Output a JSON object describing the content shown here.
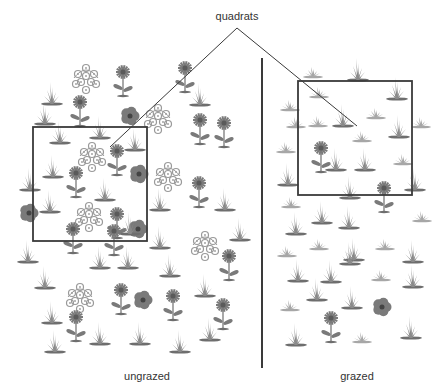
{
  "title_label": "quadrats",
  "panels": [
    {
      "id": "ungrazed",
      "label": "ungrazed",
      "label_pos": {
        "x": 147,
        "y": 370
      },
      "quadrat": {
        "x": 33,
        "y": 127,
        "w": 114,
        "h": 114
      },
      "pointer_end": {
        "x": 110,
        "y": 147
      },
      "plants": [
        {
          "type": "grass",
          "x": 52,
          "y": 104
        },
        {
          "type": "cluster",
          "x": 86,
          "y": 80
        },
        {
          "type": "daisy",
          "x": 123,
          "y": 82
        },
        {
          "type": "daisy",
          "x": 185,
          "y": 78
        },
        {
          "type": "daisy",
          "x": 80,
          "y": 112
        },
        {
          "type": "hibiscus",
          "x": 130,
          "y": 116
        },
        {
          "type": "cluster",
          "x": 158,
          "y": 120
        },
        {
          "type": "grass",
          "x": 45,
          "y": 124
        },
        {
          "type": "grass",
          "x": 100,
          "y": 138
        },
        {
          "type": "grass",
          "x": 200,
          "y": 105
        },
        {
          "type": "daisy",
          "x": 200,
          "y": 130
        },
        {
          "type": "daisy",
          "x": 224,
          "y": 133
        },
        {
          "type": "grass",
          "x": 60,
          "y": 143
        },
        {
          "type": "cluster",
          "x": 92,
          "y": 158
        },
        {
          "type": "daisy",
          "x": 117,
          "y": 161
        },
        {
          "type": "grass",
          "x": 135,
          "y": 150
        },
        {
          "type": "hibiscus",
          "x": 139,
          "y": 174
        },
        {
          "type": "cluster",
          "x": 168,
          "y": 178
        },
        {
          "type": "grass",
          "x": 53,
          "y": 177
        },
        {
          "type": "grass",
          "x": 30,
          "y": 190
        },
        {
          "type": "daisy",
          "x": 76,
          "y": 183
        },
        {
          "type": "grass",
          "x": 105,
          "y": 200
        },
        {
          "type": "grass",
          "x": 160,
          "y": 210
        },
        {
          "type": "daisy",
          "x": 199,
          "y": 193
        },
        {
          "type": "grass",
          "x": 225,
          "y": 210
        },
        {
          "type": "hibiscus",
          "x": 29,
          "y": 213
        },
        {
          "type": "grass",
          "x": 50,
          "y": 212
        },
        {
          "type": "cluster",
          "x": 89,
          "y": 218
        },
        {
          "type": "daisy",
          "x": 117,
          "y": 224
        },
        {
          "type": "hibiscus",
          "x": 138,
          "y": 229
        },
        {
          "type": "grass",
          "x": 130,
          "y": 234
        },
        {
          "type": "daisy",
          "x": 73,
          "y": 239
        },
        {
          "type": "daisy",
          "x": 114,
          "y": 241
        },
        {
          "type": "cluster",
          "x": 205,
          "y": 247
        },
        {
          "type": "grass",
          "x": 240,
          "y": 240
        },
        {
          "type": "grass",
          "x": 160,
          "y": 248
        },
        {
          "type": "grass",
          "x": 28,
          "y": 262
        },
        {
          "type": "grass",
          "x": 100,
          "y": 268
        },
        {
          "type": "grass",
          "x": 128,
          "y": 268
        },
        {
          "type": "grass",
          "x": 170,
          "y": 276
        },
        {
          "type": "daisy",
          "x": 229,
          "y": 266
        },
        {
          "type": "grass",
          "x": 45,
          "y": 288
        },
        {
          "type": "cluster",
          "x": 80,
          "y": 299
        },
        {
          "type": "daisy",
          "x": 121,
          "y": 300
        },
        {
          "type": "hibiscus",
          "x": 143,
          "y": 300
        },
        {
          "type": "daisy",
          "x": 173,
          "y": 306
        },
        {
          "type": "grass",
          "x": 205,
          "y": 296
        },
        {
          "type": "daisy",
          "x": 223,
          "y": 315
        },
        {
          "type": "grass",
          "x": 52,
          "y": 323
        },
        {
          "type": "daisy",
          "x": 76,
          "y": 327
        },
        {
          "type": "grass",
          "x": 100,
          "y": 344
        },
        {
          "type": "grass",
          "x": 140,
          "y": 344
        },
        {
          "type": "grass",
          "x": 180,
          "y": 352
        },
        {
          "type": "grass",
          "x": 55,
          "y": 352
        },
        {
          "type": "grass",
          "x": 210,
          "y": 340
        }
      ]
    },
    {
      "id": "grazed",
      "label": "grazed",
      "label_pos": {
        "x": 357,
        "y": 370
      },
      "quadrat": {
        "x": 298,
        "y": 81,
        "w": 114,
        "h": 114
      },
      "pointer_end": {
        "x": 357,
        "y": 126
      },
      "plants": [
        {
          "type": "tuft",
          "x": 313,
          "y": 77
        },
        {
          "type": "grass",
          "x": 358,
          "y": 80
        },
        {
          "type": "grass",
          "x": 397,
          "y": 99
        },
        {
          "type": "tuft",
          "x": 319,
          "y": 97
        },
        {
          "type": "tuft",
          "x": 290,
          "y": 110
        },
        {
          "type": "tuft",
          "x": 376,
          "y": 118
        },
        {
          "type": "tuft",
          "x": 296,
          "y": 127
        },
        {
          "type": "tuft",
          "x": 318,
          "y": 126
        },
        {
          "type": "grass",
          "x": 343,
          "y": 126
        },
        {
          "type": "tuft",
          "x": 362,
          "y": 141
        },
        {
          "type": "grass",
          "x": 399,
          "y": 137
        },
        {
          "type": "tuft",
          "x": 421,
          "y": 127
        },
        {
          "type": "tuft",
          "x": 286,
          "y": 152
        },
        {
          "type": "daisy",
          "x": 321,
          "y": 158
        },
        {
          "type": "grass",
          "x": 336,
          "y": 170
        },
        {
          "type": "grass",
          "x": 365,
          "y": 170
        },
        {
          "type": "tuft",
          "x": 403,
          "y": 164
        },
        {
          "type": "grass",
          "x": 288,
          "y": 185
        },
        {
          "type": "grass",
          "x": 415,
          "y": 190
        },
        {
          "type": "grass",
          "x": 350,
          "y": 198
        },
        {
          "type": "daisy",
          "x": 384,
          "y": 198
        },
        {
          "type": "tuft",
          "x": 291,
          "y": 207
        },
        {
          "type": "grass",
          "x": 322,
          "y": 223
        },
        {
          "type": "grass",
          "x": 349,
          "y": 228
        },
        {
          "type": "tuft",
          "x": 422,
          "y": 221
        },
        {
          "type": "grass",
          "x": 296,
          "y": 234
        },
        {
          "type": "tuft",
          "x": 319,
          "y": 249
        },
        {
          "type": "grass",
          "x": 354,
          "y": 260
        },
        {
          "type": "tuft",
          "x": 385,
          "y": 249
        },
        {
          "type": "grass",
          "x": 413,
          "y": 262
        },
        {
          "type": "tuft",
          "x": 287,
          "y": 256
        },
        {
          "type": "grass",
          "x": 298,
          "y": 281
        },
        {
          "type": "grass",
          "x": 331,
          "y": 282
        },
        {
          "type": "grass",
          "x": 350,
          "y": 264
        },
        {
          "type": "tuft",
          "x": 381,
          "y": 280
        },
        {
          "type": "grass",
          "x": 413,
          "y": 287
        },
        {
          "type": "grass",
          "x": 317,
          "y": 300
        },
        {
          "type": "tuft",
          "x": 290,
          "y": 310
        },
        {
          "type": "grass",
          "x": 352,
          "y": 308
        },
        {
          "type": "hibiscus",
          "x": 382,
          "y": 307
        },
        {
          "type": "daisy",
          "x": 331,
          "y": 328
        },
        {
          "type": "grass",
          "x": 296,
          "y": 345
        },
        {
          "type": "tuft",
          "x": 362,
          "y": 342
        },
        {
          "type": "grass",
          "x": 411,
          "y": 338
        }
      ]
    }
  ],
  "pointer_apex": {
    "x": 237,
    "y": 28
  },
  "title_pos": {
    "x": 237,
    "y": 10
  },
  "divider": {
    "x": 262,
    "y1": 58,
    "y2": 368
  },
  "colors": {
    "line": "#3a3a3a",
    "grass": "#8a8a8a",
    "grass_dark": "#6e6e6e",
    "flower": "#7a7a7a",
    "flower_center": "#5a5a5a",
    "cluster": "#9a9a9a",
    "text": "#333333"
  }
}
